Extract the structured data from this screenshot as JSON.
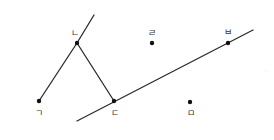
{
  "diagram": {
    "title": "",
    "background": "#ffffff",
    "stroke_color": "#2b2b2b",
    "point_color": "#111111",
    "points": [
      {
        "id": "g",
        "label": "ㄱ",
        "x": 39,
        "y": 101,
        "label_x": 39,
        "label_y": 116
      },
      {
        "id": "n",
        "label": "ㄴ",
        "x": 77,
        "y": 43,
        "label_x": 75,
        "label_y": 36
      },
      {
        "id": "d",
        "label": "ㄷ",
        "x": 114,
        "y": 101,
        "label_x": 115,
        "label_y": 116
      },
      {
        "id": "r",
        "label": "ㄹ",
        "x": 152,
        "y": 43,
        "label_x": 152,
        "label_y": 36
      },
      {
        "id": "b",
        "label": "ㅂ",
        "x": 228,
        "y": 43,
        "label_x": 228,
        "label_y": 35
      },
      {
        "id": "m",
        "label": "ㅁ",
        "x": 190,
        "y": 102,
        "label_x": 191,
        "label_y": 116
      }
    ],
    "segments": [
      {
        "id": "ray-n-up",
        "x1": 77,
        "y1": 43,
        "x2": 94,
        "y2": 15
      },
      {
        "id": "seg-g-n",
        "x1": 39,
        "y1": 101,
        "x2": 77,
        "y2": 43
      },
      {
        "id": "seg-n-d",
        "x1": 77,
        "y1": 43,
        "x2": 114,
        "y2": 101
      },
      {
        "id": "line-d-b",
        "x1": 77,
        "y1": 121,
        "x2": 253,
        "y2": 30
      }
    ],
    "faint_marks": {
      "x": 266,
      "y": 73,
      "text": "· ·"
    }
  }
}
